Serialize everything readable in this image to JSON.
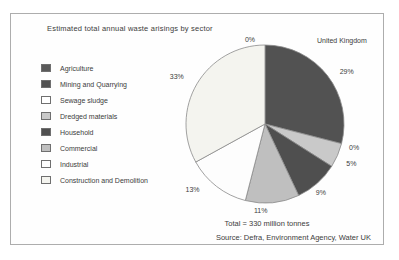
{
  "title": "Estimated total annual waste arisings by sector",
  "region_label": "United Kingdom",
  "total_note": "Total = 330 million tonnes",
  "source": "Source: Defra, Environment Agency, Water UK",
  "chart_data": {
    "type": "pie",
    "title": "Estimated total annual waste arisings by sector",
    "region": "United Kingdom",
    "unit": "percent",
    "total_label": "Total = 330 million tonnes",
    "total_million_tonnes": 330,
    "start_angle_deg": 0,
    "direction": "clockwise",
    "legend_position": "left",
    "slices": [
      {
        "label": "Agriculture",
        "value": 0,
        "color": "#5a5a5a"
      },
      {
        "label": "Mining and Quarrying",
        "value": 29,
        "color": "#525252"
      },
      {
        "label": "Sewage sludge",
        "value": 0,
        "color": "#ffffff"
      },
      {
        "label": "Dredged materials",
        "value": 5,
        "color": "#c9c9c9"
      },
      {
        "label": "Household",
        "value": 9,
        "color": "#4f4f4f"
      },
      {
        "label": "Commercial",
        "value": 11,
        "color": "#bfbfbf"
      },
      {
        "label": "Industrial",
        "value": 13,
        "color": "#fdfdfd"
      },
      {
        "label": "Construction and Demolition",
        "value": 33,
        "color": "#f4f4ef"
      }
    ]
  }
}
